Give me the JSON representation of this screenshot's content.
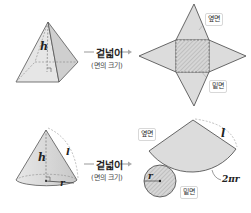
{
  "pyramid_row": {
    "height_label": "h",
    "arrow": {
      "title": "겉넓이",
      "subtitle": "(면의 크기)"
    },
    "net_labels": {
      "lateral": "옆면",
      "base": "밑면"
    }
  },
  "cone_row": {
    "height_label": "h",
    "slant_label": "l",
    "radius_label": "r",
    "arrow": {
      "title": "겉넓이",
      "subtitle": "(면의 크기)"
    },
    "net_labels": {
      "lateral": "옆면",
      "base": "밑면",
      "slant": "l",
      "radius": "r",
      "arc": "2πr"
    }
  },
  "colors": {
    "fill": "#dcdcdc",
    "stroke": "#444444",
    "dash": "#666666",
    "arrow": "#aaaaaa"
  }
}
